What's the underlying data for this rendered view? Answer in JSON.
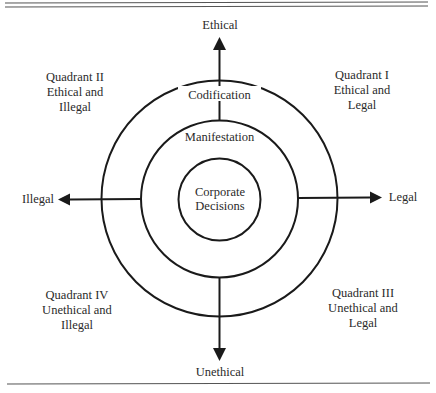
{
  "diagram": {
    "type": "concentric-circles-with-axes",
    "axes": {
      "top": "Ethical",
      "bottom": "Unethical",
      "left": "Illegal",
      "right": "Legal"
    },
    "rings": {
      "outer": "Codification",
      "middle": "Manifestation",
      "inner_line1": "Corporate",
      "inner_line2": "Decisions"
    },
    "quadrants": {
      "q1": {
        "title": "Quadrant I",
        "line2": "Ethical and",
        "line3": "Legal"
      },
      "q2": {
        "title": "Quadrant II",
        "line2": "Ethical and",
        "line3": "Illegal"
      },
      "q3": {
        "title": "Quadrant III",
        "line2": "Unethical and",
        "line3": "Legal"
      },
      "q4": {
        "title": "Quadrant IV",
        "line2": "Unethical and",
        "line3": "Illegal"
      }
    },
    "colors": {
      "stroke": "#1a1a1a",
      "rule": "#555555",
      "text": "#2a2a2a",
      "background": "#ffffff"
    }
  }
}
